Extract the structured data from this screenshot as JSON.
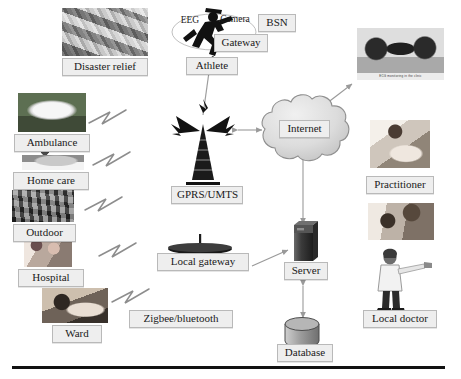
{
  "diagram": {
    "baseline_rule": true,
    "nodes": {
      "disaster_relief": "Disaster relief",
      "ambulance": "Ambulance",
      "home_care": "Home care",
      "outdoor": "Outdoor",
      "hospital": "Hospital",
      "ward": "Ward",
      "eeg": "EEG",
      "camera": "Camera",
      "bsn": "BSN",
      "gateway": "Gateway",
      "athlete": "Athlete",
      "gprs_umts": "GPRS/UMTS",
      "local_gateway": "Local gateway",
      "zigbee_bluetooth": "Zigbee/bluetooth",
      "internet": "Internet",
      "server": "Server",
      "database": "Database",
      "practitioner": "Practitioner",
      "local_doctor": "Local doctor",
      "clinic_photo_caption": "ECG monitoring in the clinic"
    },
    "icons": {
      "athlete": "running-person-icon",
      "tower": "radio-tower-icon",
      "local_gateway": "satellite-dish-icon",
      "cloud": "cloud-icon",
      "server": "server-tower-icon",
      "database": "database-cylinder-icon",
      "doctor": "doctor-person-icon",
      "wireless_link": "lightning-link-icon"
    },
    "colors": {
      "chip_fill": "#eeeeee",
      "chip_border": "#b9b9b9",
      "text": "#1a1a1a",
      "cloud_fill": "#d9d9d9",
      "cloud_stroke": "#8f8f8f",
      "server_fill": "#3f3f3f",
      "database_fill": "#9e9e9e",
      "arrow": "#9a9a9a",
      "rule": "#121212",
      "background": "#ffffff"
    },
    "edges": [
      {
        "from": "ambulance",
        "to": "gprs_umts",
        "style": "lightning"
      },
      {
        "from": "home_care",
        "to": "gprs_umts",
        "style": "lightning"
      },
      {
        "from": "outdoor",
        "to": "local_gateway",
        "style": "lightning"
      },
      {
        "from": "hospital",
        "to": "local_gateway",
        "style": "lightning"
      },
      {
        "from": "ward",
        "to": "local_gateway",
        "style": "lightning"
      },
      {
        "from": "athlete",
        "to": "gprs_umts",
        "style": "line"
      },
      {
        "from": "gprs_umts",
        "to": "internet",
        "style": "double-arrow"
      },
      {
        "from": "internet",
        "to": "clinic_photo",
        "style": "arrow"
      },
      {
        "from": "internet",
        "to": "server",
        "style": "double-arrow"
      },
      {
        "from": "local_gateway",
        "to": "server",
        "style": "arrow"
      },
      {
        "from": "server",
        "to": "database",
        "style": "double-arrow"
      }
    ]
  }
}
